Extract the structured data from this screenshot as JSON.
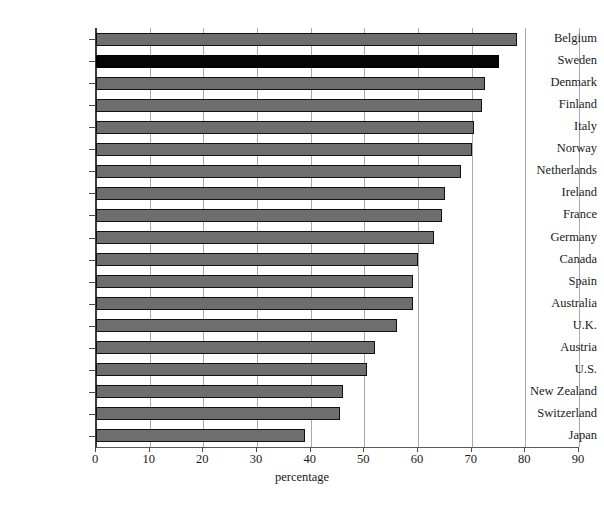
{
  "chart_data": {
    "type": "bar",
    "orientation": "horizontal",
    "title": "",
    "xlabel": "percentage",
    "ylabel": "",
    "xlim": [
      0,
      90
    ],
    "xticks": [
      0,
      10,
      20,
      30,
      40,
      50,
      60,
      70,
      80,
      90
    ],
    "grid": true,
    "legend": false,
    "highlight_category": "Sweden",
    "colors": {
      "bar": "#6e6e6e",
      "bar_border": "#111111",
      "highlight": "#050505",
      "gridline": "#a9a9a9",
      "axis": "#3a3a3a",
      "background": "#ffffff"
    },
    "categories": [
      "Belgium",
      "Sweden",
      "Denmark",
      "Finland",
      "Italy",
      "Norway",
      "Netherlands",
      "Ireland",
      "France",
      "Germany",
      "Canada",
      "Spain",
      "Australia",
      "U.K.",
      "Austria",
      "U.S.",
      "New Zealand",
      "Switzerland",
      "Japan"
    ],
    "values": [
      78.5,
      75.0,
      72.5,
      72.0,
      70.5,
      70.0,
      68.0,
      65.0,
      64.5,
      63.0,
      60.0,
      59.0,
      59.0,
      56.0,
      52.0,
      50.5,
      46.0,
      45.5,
      39.0
    ]
  },
  "footer": {
    "caption": ""
  }
}
